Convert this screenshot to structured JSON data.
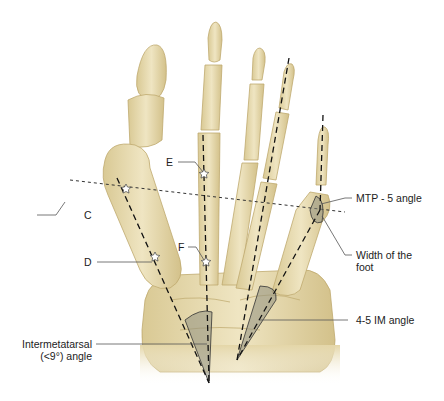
{
  "figure": {
    "colors": {
      "bone": "#e8dcb0",
      "bone_shadow": "#cbb985",
      "line": "#1a1a1a",
      "angle_fill": "#9a9a8a",
      "leader": "#555555"
    }
  },
  "labels": {
    "C": "C",
    "D": "D",
    "E": "E",
    "F": "F",
    "mtp5": "MTP - 5 angle",
    "width_line1": "Width of the",
    "width_line2": "foot",
    "im45": "4-5 IM angle",
    "intermetatarsal_line1": "Intermetatarsal",
    "intermetatarsal_line2": "(<9°) angle"
  }
}
